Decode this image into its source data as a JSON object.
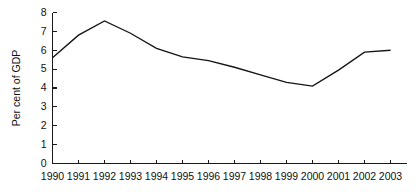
{
  "chart_data": {
    "type": "line",
    "title": "",
    "xlabel": "",
    "ylabel": "Per cent of GDP",
    "categories": [
      "1990",
      "1991",
      "1992",
      "1993",
      "1994",
      "1995",
      "1996",
      "1997",
      "1998",
      "1999",
      "2000",
      "2001",
      "2002",
      "2003"
    ],
    "values": [
      5.6,
      6.8,
      7.55,
      6.9,
      6.1,
      5.65,
      5.45,
      5.1,
      4.7,
      4.3,
      4.1,
      4.95,
      5.9,
      6.0
    ],
    "series": [
      {
        "name": "Per cent of GDP",
        "values": [
          5.6,
          6.8,
          7.55,
          6.9,
          6.1,
          5.65,
          5.45,
          5.1,
          4.7,
          4.3,
          4.1,
          4.95,
          5.9,
          6.0
        ]
      }
    ],
    "ylim": [
      0,
      8
    ],
    "yticks": [
      0,
      1,
      2,
      3,
      4,
      5,
      6,
      7,
      8
    ],
    "ytick_labels": [
      "0",
      "1",
      "2",
      "3",
      "4",
      "5",
      "6",
      "7",
      "8"
    ],
    "xtick_labels": [
      "1990",
      "1991",
      "1992",
      "1993",
      "1994",
      "1995",
      "1996",
      "1997",
      "1998",
      "1999",
      "2000",
      "2001",
      "2002",
      "2003"
    ],
    "grid": false,
    "legend": false,
    "legend_position": "none",
    "line_color": "#141414",
    "axis_color": "#1a1a1a",
    "background_color": "#ffffff",
    "tick_direction": "in"
  }
}
